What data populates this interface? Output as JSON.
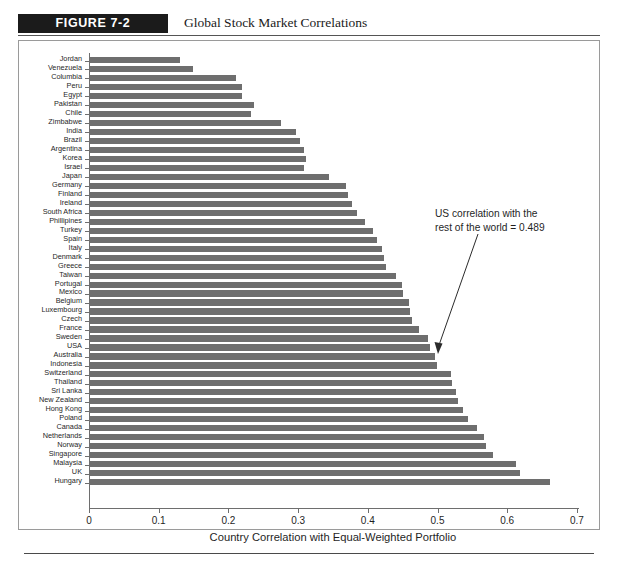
{
  "figure": {
    "tag": "FIGURE 7-2",
    "title": "Global Stock Market Correlations"
  },
  "annotation": {
    "line1": "US correlation with the",
    "line2": "rest of the world = 0.489"
  },
  "chart_data": {
    "type": "bar",
    "orientation": "horizontal",
    "title": "Global Stock Market Correlations",
    "xlabel": "Country Correlation with Equal-Weighted Portfolio",
    "ylabel": "",
    "xlim": [
      0,
      0.7
    ],
    "grid": false,
    "legend": null,
    "bar_color": "#6e6e6e",
    "xticks": [
      "0",
      "0.1",
      "0.2",
      "0.3",
      "0.4",
      "0.5",
      "0.6",
      "0.7"
    ],
    "xtick_values": [
      0,
      0.1,
      0.2,
      0.3,
      0.4,
      0.5,
      0.6,
      0.7
    ],
    "categories": [
      "Jordan",
      "Venezuela",
      "Columbia",
      "Peru",
      "Egypt",
      "Pakistan",
      "Chile",
      "Zimbabwe",
      "India",
      "Brazil",
      "Argentina",
      "Korea",
      "Israel",
      "Japan",
      "Germany",
      "Finland",
      "Ireland",
      "South Africa",
      "Phillipines",
      "Turkey",
      "Spain",
      "Italy",
      "Denmark",
      "Greece",
      "Taiwan",
      "Portugal",
      "Mexico",
      "Belgium",
      "Luxembourg",
      "Czech",
      "France",
      "Sweden",
      "USA",
      "Australia",
      "Indonesia",
      "Switzerland",
      "Thailand",
      "Sri Lanka",
      "New Zealand",
      "Hong Kong",
      "Poland",
      "Canada",
      "Netherlands",
      "Norway",
      "Singapore",
      "Malaysia",
      "UK",
      "Hungary"
    ],
    "values": [
      0.131,
      0.149,
      0.211,
      0.219,
      0.22,
      0.237,
      0.233,
      0.276,
      0.297,
      0.303,
      0.309,
      0.311,
      0.309,
      0.344,
      0.369,
      0.372,
      0.377,
      0.384,
      0.396,
      0.407,
      0.413,
      0.42,
      0.423,
      0.426,
      0.441,
      0.449,
      0.451,
      0.459,
      0.461,
      0.464,
      0.473,
      0.487,
      0.489,
      0.496,
      0.499,
      0.519,
      0.521,
      0.526,
      0.529,
      0.537,
      0.544,
      0.556,
      0.567,
      0.57,
      0.58,
      0.613,
      0.619,
      0.661
    ],
    "annotations": [
      {
        "text": "US correlation with the rest of the world = 0.489",
        "points_to_category": "USA",
        "value": 0.489
      }
    ]
  }
}
